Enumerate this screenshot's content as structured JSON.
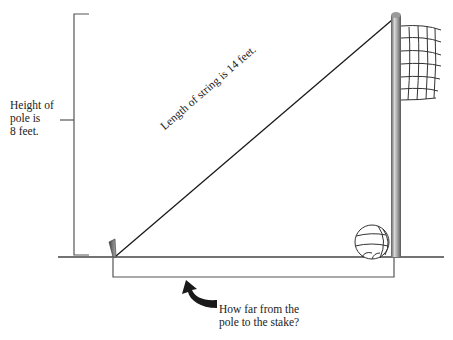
{
  "diagram": {
    "height_label": {
      "line1": "Height of",
      "line2": "pole is",
      "line3": "8 feet."
    },
    "string_label": "Length of string is 14 feet.",
    "question_label": {
      "line1": "How far from the",
      "line2": "pole to the stake?"
    },
    "elements": {
      "pole": "volleyball-net-pole",
      "net": "volleyball-net",
      "ball": "volleyball",
      "stake": "ground-stake",
      "string": "string-from-pole-top-to-stake",
      "ground": "ground-line",
      "arrow": "curved-arrow-pointing-to-distance-bracket"
    },
    "values": {
      "pole_height_ft": 8,
      "string_length_ft": 14
    },
    "colors": {
      "line": "#222222",
      "bracket": "#555555",
      "pole_dark": "#6e6e6e",
      "pole_light": "#cfcfcf"
    }
  }
}
